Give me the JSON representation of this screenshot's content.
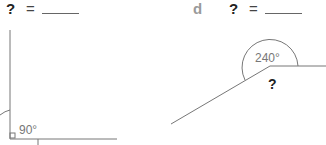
{
  "problems": [
    {
      "letter": "",
      "unknown_symbol": "?",
      "equals": "=",
      "answer_value": "",
      "given_angle_label": "90°",
      "right_angle_marker": true
    },
    {
      "letter": "d",
      "unknown_symbol": "?",
      "equals": "=",
      "answer_value": "",
      "given_angle_label": "240°",
      "unknown_angle_label": "?"
    }
  ],
  "colors": {
    "line": "#666666",
    "letter": "#9a9a9a",
    "angle_text": "#777777",
    "question": "#222222"
  }
}
